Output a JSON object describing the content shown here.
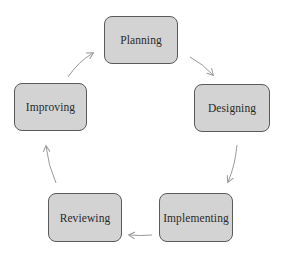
{
  "diagram": {
    "type": "cycle",
    "colors": {
      "node_fill": "#d3d3d3",
      "node_border": "#5a5a5a",
      "text": "#2a2a2a",
      "arrow": "#9a9a9a",
      "background": "#ffffff"
    },
    "nodes": [
      {
        "id": "planning",
        "label": "Planning"
      },
      {
        "id": "designing",
        "label": "Designing"
      },
      {
        "id": "implementing",
        "label": "Implementing"
      },
      {
        "id": "reviewing",
        "label": "Reviewing"
      },
      {
        "id": "improving",
        "label": "Improving"
      }
    ],
    "edges": [
      {
        "from": "planning",
        "to": "designing"
      },
      {
        "from": "designing",
        "to": "implementing"
      },
      {
        "from": "implementing",
        "to": "reviewing"
      },
      {
        "from": "reviewing",
        "to": "improving"
      },
      {
        "from": "improving",
        "to": "planning"
      }
    ]
  }
}
